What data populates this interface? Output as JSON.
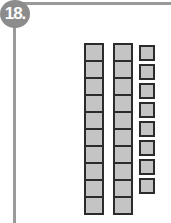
{
  "problem": {
    "number_label": "18.",
    "accent_color": "#8c8c8c"
  },
  "blocks": {
    "tens_rods": 2,
    "units_per_rod": 10,
    "ones_cubes": 8,
    "fill_color": "#c4c4c4",
    "border_color": "#2b2b2b"
  }
}
